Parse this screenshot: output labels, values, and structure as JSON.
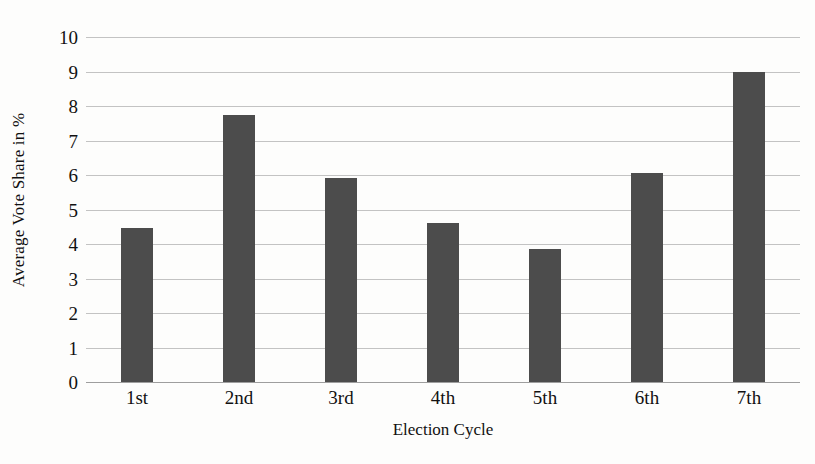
{
  "chart_data": {
    "type": "bar",
    "title": "",
    "xlabel": "Election Cycle",
    "ylabel": "Average Vote Share in %",
    "categories": [
      "1st",
      "2nd",
      "3rd",
      "4th",
      "5th",
      "6th",
      "7th"
    ],
    "values": [
      4.45,
      7.75,
      5.9,
      4.6,
      3.85,
      6.05,
      9.0
    ],
    "ylim": [
      0,
      10
    ],
    "ytick_labels": [
      "10",
      "9",
      "8",
      "7",
      "6",
      "5",
      "4",
      "3",
      "2",
      "1",
      "0"
    ],
    "ytick_values": [
      10,
      9,
      8,
      7,
      6,
      5,
      4,
      3,
      2,
      1,
      0
    ],
    "ytick_step": 1,
    "grid": true,
    "legend": "none",
    "series_name": "Average Vote Share",
    "bar_color": "#4c4c4c",
    "gridline_color": "#b9b9b9",
    "background_color": "#fdfdfc"
  }
}
